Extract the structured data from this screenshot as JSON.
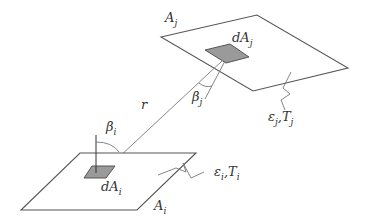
{
  "diagram": {
    "type": "radiative view factor between two surfaces",
    "surface_j": {
      "area_label": "A",
      "area_sub": "j",
      "patch_label": "dA",
      "patch_sub": "j",
      "angle_label": "β",
      "angle_sub": "j",
      "props_e": "ε",
      "props_e_sub": "j",
      "props_sep": ",",
      "props_t": "T",
      "props_t_sub": "j"
    },
    "surface_i": {
      "area_label": "A",
      "area_sub": "i",
      "patch_label": "dA",
      "patch_sub": "i",
      "angle_label": "β",
      "angle_sub": "i",
      "props_e": "ε",
      "props_e_sub": "i",
      "props_sep": ",",
      "props_t": "T",
      "props_t_sub": "i"
    },
    "distance_label": "r",
    "colors": {
      "stroke": "#555555",
      "patch_fill": "#9a9a9a",
      "background": "#ffffff"
    }
  }
}
